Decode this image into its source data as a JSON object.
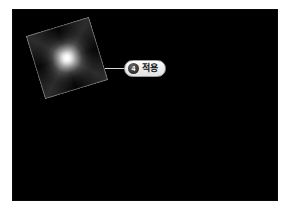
{
  "page": {
    "background_color": "#ffffff"
  },
  "canvas": {
    "name": "preview-canvas",
    "background_color": "#000000"
  },
  "shape": {
    "name": "gradient-square",
    "kind": "rotated-square-radial-gradient",
    "rotation_degrees": -17,
    "center_color": "#ffffff",
    "edge_color": "#000000",
    "border_color": "#9e9e9e"
  },
  "callout": {
    "name": "step-callout",
    "badge_number": "4",
    "label": "적용",
    "badge_color": "#2b2b2b",
    "pill_background": "#ededed",
    "pill_border": "#9a9a9a",
    "connector_color": "#d8d8d8"
  }
}
